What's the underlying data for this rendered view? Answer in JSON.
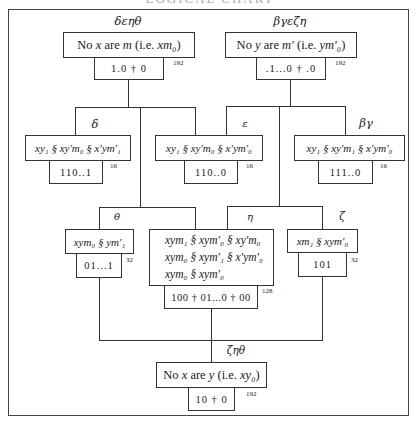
{
  "heading": "LOGICAL CHART",
  "nodes": {
    "top_left": {
      "label": "δεηθ",
      "premise_prefix": "No ",
      "premise_var1": "x",
      "premise_mid": " are ",
      "premise_var2": "m",
      "premise_paren_open": " (i.e. ",
      "premise_code": "xm₀",
      "premise_paren_close": ")",
      "code": "1.0 † 0",
      "count": "192"
    },
    "top_right": {
      "label": "βγεζη",
      "premise_prefix": "No ",
      "premise_var1": "y",
      "premise_mid": " are ",
      "premise_var2": "m′",
      "premise_paren_open": " (i.e. ",
      "premise_code": "ym′₀",
      "premise_paren_close": ")",
      "code": ".1...0 † .0",
      "count": "192"
    },
    "delta": {
      "label": "δ",
      "formula": "xy₁ § xy′m₀ § x′ym′₁",
      "code": "110..1",
      "count": "16"
    },
    "epsilon": {
      "label": "ε",
      "formula": "xy₁ § xy′m₀ § x′ym′₀",
      "code": "110..0",
      "count": "16"
    },
    "beta_gamma": {
      "label": "βγ",
      "formula": "xy₁ § xy′m₁ § x′ym′₀",
      "code": "111..0",
      "count": "16"
    },
    "theta": {
      "label": "θ",
      "formula": "xym₀ § ym′₁",
      "code": "01...1",
      "count": "32"
    },
    "eta": {
      "label": "η",
      "formula_lines": [
        "xym₁ § xym′₀ § xy′m₀",
        "xym₀ § xym′₁ § x′ym′₀",
        "xym₀ § xym′₀"
      ],
      "code": "100 † 01...0 † 00",
      "count": "128"
    },
    "zeta": {
      "label": "ζ",
      "formula": "xm₁ § xym′₀",
      "code": "101",
      "count": "32"
    },
    "conclusion": {
      "label": "ζηθ",
      "premise_prefix": "No ",
      "premise_var1": "x",
      "premise_mid": " are ",
      "premise_var2": "y",
      "premise_paren_open": " (i.e. ",
      "premise_code": "xy₀",
      "premise_paren_close": ")",
      "code": "10 † 0",
      "count": "192"
    }
  }
}
